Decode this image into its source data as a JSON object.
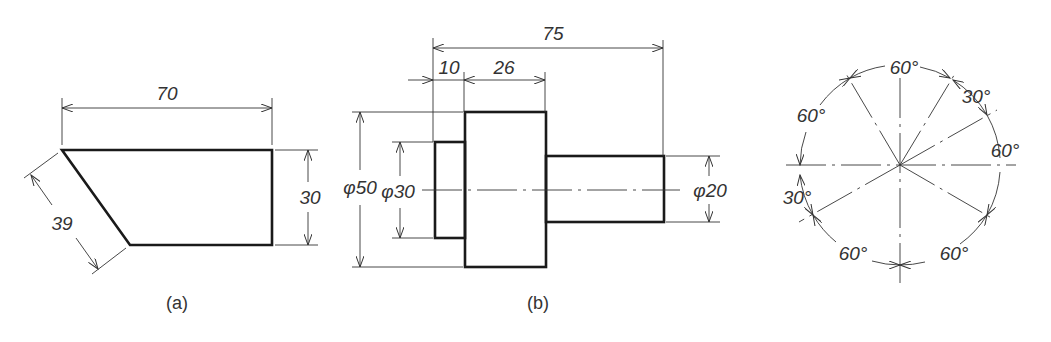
{
  "figures": [
    {
      "id": "a",
      "caption": "(a)",
      "description": "Trapezoid plate with chamfered left edge",
      "dimensions": {
        "width": "70",
        "height": "30",
        "slant": "39"
      }
    },
    {
      "id": "b",
      "caption": "(b)",
      "description": "Stepped shaft side view",
      "dimensions": {
        "overall_length": "75",
        "left_step_length": "10",
        "middle_length": "26",
        "dia_large": "φ50",
        "dia_left": "φ30",
        "dia_right": "φ20"
      }
    },
    {
      "id": "c",
      "caption": "",
      "description": "Circle with angular dimensions",
      "angles": {
        "top": "60°",
        "top_right": "30°",
        "right": "60°",
        "bottom_right": "60°",
        "bottom_left": "60°",
        "left": "30°",
        "top_left": "60°"
      }
    }
  ],
  "colors": {
    "line": "#1a1a1a",
    "text": "#333333",
    "background": "#ffffff"
  }
}
